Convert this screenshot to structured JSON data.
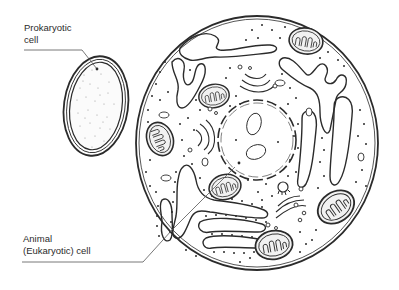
{
  "diagram": {
    "type": "cell-comparison-illustration",
    "labels": {
      "prokaryotic": {
        "line1": "Prokaryotic",
        "line2": "cell"
      },
      "eukaryotic": {
        "line1": "Animal",
        "line2": "(Eukaryotic) cell"
      }
    },
    "structures": [
      "prokaryotic-cell",
      "eukaryotic-cell",
      "nucleus",
      "nucleoli",
      "mitochondria",
      "rough-endoplasmic-reticulum",
      "smooth-endoplasmic-reticulum",
      "golgi-apparatus",
      "centriole",
      "vesicles",
      "ribosomes"
    ],
    "colors": {
      "line": "#2b2b2b",
      "background": "#ffffff",
      "mito_fill": "#f2f2f2"
    }
  }
}
